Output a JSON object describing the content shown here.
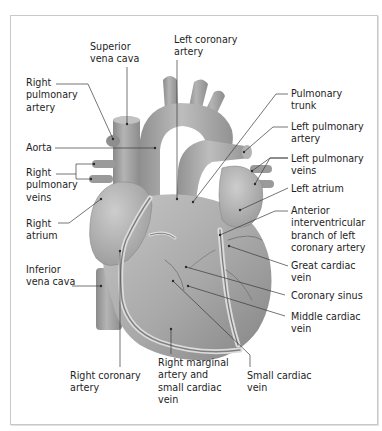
{
  "diagram": {
    "colors": {
      "frame_border": "#c8c8c8",
      "heart_fill": "#a9a9a9",
      "heart_light": "#c4c4c4",
      "heart_dark": "#7c7c7c",
      "vessel_fill": "#9b9b9b",
      "leader_line": "#3a3a3a",
      "text": "#1e1e1e"
    },
    "labels": [
      {
        "id": "superior-vena-cava",
        "text": "Superior\nvena cava",
        "x": 90,
        "y": 41
      },
      {
        "id": "left-coronary-artery",
        "text": "Left coronary\nartery",
        "x": 174,
        "y": 34
      },
      {
        "id": "right-pulmonary-artery",
        "text": "Right\npulmonary\nartery",
        "x": 26,
        "y": 77
      },
      {
        "id": "pulmonary-trunk",
        "text": "Pulmonary\ntrunk",
        "x": 291,
        "y": 88
      },
      {
        "id": "left-pulmonary-artery",
        "text": "Left pulmonary\nartery",
        "x": 291,
        "y": 121
      },
      {
        "id": "aorta",
        "text": "Aorta",
        "x": 26,
        "y": 142
      },
      {
        "id": "right-pulmonary-veins",
        "text": "Right\npulmonary\nveins",
        "x": 26,
        "y": 167
      },
      {
        "id": "left-pulmonary-veins",
        "text": "Left pulmonary\nveins",
        "x": 291,
        "y": 153
      },
      {
        "id": "left-atrium",
        "text": "Left atrium",
        "x": 291,
        "y": 183
      },
      {
        "id": "anterior-interventricular-branch",
        "text": "Anterior\ninterventricular\nbranch of left\ncoronary artery",
        "x": 291,
        "y": 205
      },
      {
        "id": "right-atrium",
        "text": "Right\natrium",
        "x": 26,
        "y": 218
      },
      {
        "id": "inferior-vena-cava",
        "text": "Inferior\nvena cava",
        "x": 26,
        "y": 264
      },
      {
        "id": "great-cardiac-vein",
        "text": "Great cardiac\nvein",
        "x": 291,
        "y": 260
      },
      {
        "id": "coronary-sinus",
        "text": "Coronary sinus",
        "x": 291,
        "y": 290
      },
      {
        "id": "middle-cardiac-vein",
        "text": "Middle cardiac\nvein",
        "x": 291,
        "y": 311
      },
      {
        "id": "right-marginal-artery",
        "text": "Right marginal\nartery and\nsmall cardiac\nvein",
        "x": 158,
        "y": 357
      },
      {
        "id": "right-coronary-artery",
        "text": "Right coronary\nartery",
        "x": 70,
        "y": 370
      },
      {
        "id": "small-cardiac-vein",
        "text": "Small cardiac\nvein",
        "x": 247,
        "y": 370
      }
    ],
    "leaders": [
      {
        "id": "superior-vena-cava",
        "points": "127,67 127,124"
      },
      {
        "id": "left-coronary-artery",
        "points": "177,60 177,199"
      },
      {
        "id": "right-pulmonary-artery",
        "points": "56,84 88,84 113,139"
      },
      {
        "id": "pulmonary-trunk",
        "points": "288,94 276,94 193,202"
      },
      {
        "id": "left-pulmonary-artery",
        "points": "288,127 273,127 244,152"
      },
      {
        "id": "aorta",
        "points": "55,148 155,148"
      },
      {
        "id": "right-pulmonary-veins-a",
        "points": "56,174 76,174 76,164 94,164"
      },
      {
        "id": "right-pulmonary-veins-b",
        "points": "76,174 76,179 91,179"
      },
      {
        "id": "left-pulmonary-veins-a",
        "points": "288,158 270,158 252,171"
      },
      {
        "id": "left-pulmonary-veins-b",
        "points": "288,158 270,158 255,184"
      },
      {
        "id": "left-atrium",
        "points": "288,188 240,210"
      },
      {
        "id": "anterior-interventricular-branch",
        "points": "288,211 275,211 220,235"
      },
      {
        "id": "right-atrium",
        "points": "58,223 69,223 101,199"
      },
      {
        "id": "inferior-vena-cava",
        "points": "72,286 101,286"
      },
      {
        "id": "great-cardiac-vein",
        "points": "288,266 229,246"
      },
      {
        "id": "coronary-sinus",
        "points": "285,295 186,267"
      },
      {
        "id": "middle-cardiac-vein",
        "points": "285,316 188,286"
      },
      {
        "id": "right-marginal-artery",
        "points": "171,354 171,329"
      },
      {
        "id": "right-coronary-artery",
        "points": "120,367 120,251"
      },
      {
        "id": "small-cardiac-vein",
        "points": "250,367 250,355 173,281"
      }
    ]
  }
}
